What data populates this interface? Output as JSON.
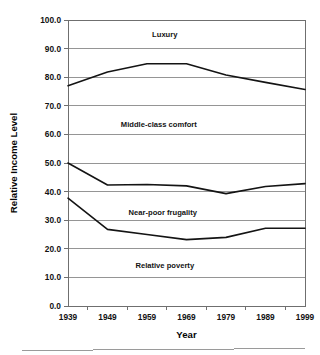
{
  "chart_data": {
    "type": "line",
    "title": "",
    "xlabel": "Year",
    "ylabel": "Relative Income Level",
    "categories": [
      "1939",
      "1949",
      "1959",
      "1969",
      "1979",
      "1989",
      "1999"
    ],
    "x": [
      1939,
      1949,
      1959,
      1969,
      1979,
      1989,
      1999
    ],
    "ylim": [
      0.0,
      100.0
    ],
    "y_ticks": [
      "0.0",
      "10.0",
      "20.0",
      "30.0",
      "40.0",
      "50.0",
      "60.0",
      "70.0",
      "80.0",
      "90.0",
      "100.0"
    ],
    "y_tick_values": [
      0,
      10,
      20,
      30,
      40,
      50,
      60,
      70,
      80,
      90,
      100
    ],
    "grid": true,
    "grid_axis": "y",
    "legend": "none",
    "series": [
      {
        "name": "upper-boundary",
        "values": [
          77.0,
          81.8,
          84.7,
          84.7,
          80.8,
          78.2,
          75.7
        ],
        "color": "#141414"
      },
      {
        "name": "middle-boundary",
        "values": [
          50.0,
          42.3,
          42.5,
          42.0,
          39.3,
          41.8,
          42.8
        ],
        "color": "#141414"
      },
      {
        "name": "lower-boundary",
        "values": [
          37.7,
          26.8,
          25.0,
          23.2,
          24.0,
          27.2,
          27.2
        ],
        "color": "#141414"
      }
    ],
    "annotations": [
      {
        "text": "Luxury",
        "x_value": 1963.5,
        "y_value": 95.0
      },
      {
        "text": "Middle-class comfort",
        "x_value": 1962.0,
        "y_value": 63.5
      },
      {
        "text": "Near-poor frugality",
        "x_value": 1963.0,
        "y_value": 33.0
      },
      {
        "text": "Relative poverty",
        "x_value": 1963.5,
        "y_value": 14.5
      }
    ]
  },
  "colors": {
    "line": "#141414",
    "grid": "#8a8a8a",
    "frame": "#6f6f6f",
    "text": "#121212",
    "background": "#ffffff"
  }
}
